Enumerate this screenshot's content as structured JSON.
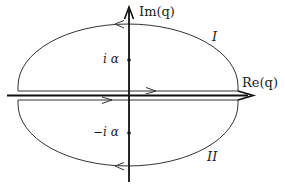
{
  "diagram": {
    "type": "complex-plane contour diagram",
    "axes": {
      "vertical_label": "Im(q)",
      "horizontal_label": "Re(q)"
    },
    "ticks": {
      "upper": "i α",
      "lower": "−i α"
    },
    "regions": {
      "upper": "I",
      "lower": "II"
    },
    "contours": [
      {
        "name": "upper-contour",
        "region": "I",
        "orientation": "counterclockwise",
        "straight_segment_direction": "right",
        "arc_direction": "left"
      },
      {
        "name": "lower-contour",
        "region": "II",
        "orientation": "clockwise",
        "straight_segment_direction": "right",
        "arc_direction": "left"
      }
    ],
    "colors": {
      "ink": "#222222",
      "background": "#ffffff"
    }
  }
}
